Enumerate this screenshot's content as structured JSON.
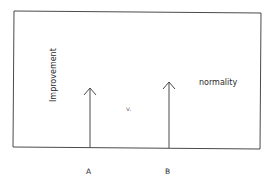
{
  "diagram": {
    "y_axis_label": "Improvement",
    "right_label": "normality",
    "center_label": "v.",
    "arrows": [
      {
        "id": "A",
        "label": "A",
        "x": 90,
        "tip_y": 88,
        "base_y": 148
      },
      {
        "id": "B",
        "label": "B",
        "x": 169,
        "tip_y": 82,
        "base_y": 148
      }
    ],
    "colors": {
      "stroke": "#4a4a4a",
      "text": "#2a2a2a",
      "muted_text": "#6a6a6a",
      "background": "#ffffff"
    }
  }
}
